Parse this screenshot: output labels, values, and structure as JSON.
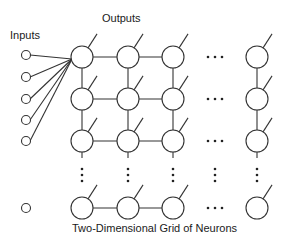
{
  "diagram": {
    "title": "Two-Dimensional Grid of Neurons",
    "labels": {
      "inputs": "Inputs",
      "outputs": "Outputs",
      "caption": "Two-Dimensional Grid of Neurons"
    },
    "input_nodes": [
      {
        "x": 26,
        "y": 55
      },
      {
        "x": 26,
        "y": 77
      },
      {
        "x": 26,
        "y": 99
      },
      {
        "x": 26,
        "y": 120
      },
      {
        "x": 26,
        "y": 141
      },
      {
        "x": 26,
        "y": 208
      }
    ],
    "grid": {
      "columns_x": [
        82,
        128,
        173,
        257
      ],
      "rows_y": [
        57,
        99,
        141,
        208
      ],
      "node_radius": 11,
      "ellipsis_column_x": 215,
      "ellipsis_row_y": 175
    },
    "connections": "All visible inputs connect to the top-left neuron; neighboring neurons connect horizontally and vertically; each neuron has an output line."
  }
}
